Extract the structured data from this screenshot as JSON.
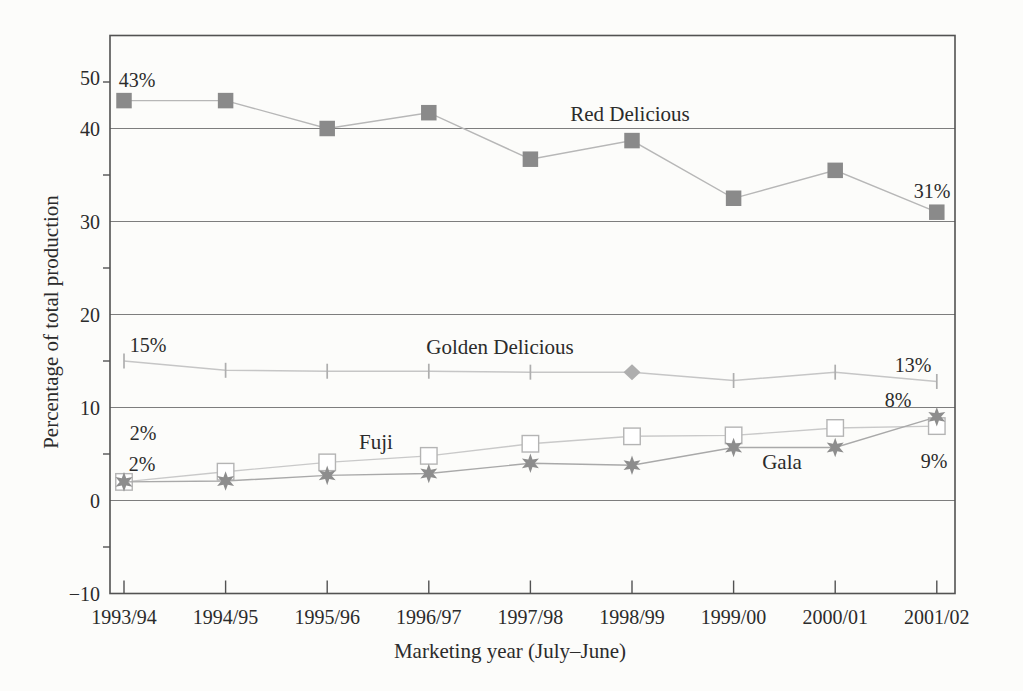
{
  "figure": {
    "background_color": "#fcfcfa",
    "text_color": "#2b2b2b",
    "grid_color": "#7d7d7d",
    "border_color": "#525252"
  },
  "chart_data": {
    "type": "line",
    "title": "",
    "xlabel": "Marketing year (July–June)",
    "ylabel": "Percentage of total production",
    "categories": [
      "1993/94",
      "1994/95",
      "1995/96",
      "1996/97",
      "1997/98",
      "1998/99",
      "1999/00",
      "2000/01",
      "2001/02"
    ],
    "ylim": [
      -10,
      50
    ],
    "grid": true,
    "gridlines_at": [
      40,
      30,
      20,
      10,
      0
    ],
    "yticks": [
      {
        "label": "50",
        "value": 50,
        "label_y": 78
      },
      {
        "label": "40",
        "value": 40
      },
      {
        "label": "30",
        "value": 30
      },
      {
        "label": "20",
        "value": 20
      },
      {
        "label": "10",
        "value": 10
      },
      {
        "label": "0",
        "value": 0
      },
      {
        "label": "−10",
        "value": -10
      }
    ],
    "minor_yticks": [
      45,
      35,
      25,
      15,
      5,
      -5
    ],
    "legend_position": "inline-labels",
    "series": [
      {
        "name": "Red Delicious",
        "marker": "filled-square",
        "marker_color": "#8a8a8a",
        "line_color": "#b7b7b7",
        "values": [
          43,
          43,
          40,
          41.7,
          36.7,
          38.7,
          32.5,
          35.5,
          31
        ]
      },
      {
        "name": "Golden Delicious",
        "marker": "vertical-tick",
        "special_marker": {
          "index": 5,
          "shape": "diamond"
        },
        "marker_color": "#aeaeae",
        "line_color": "#c6c6c6",
        "values": [
          15,
          14,
          13.9,
          13.9,
          13.8,
          13.8,
          12.9,
          13.8,
          12.8
        ]
      },
      {
        "name": "Fuji",
        "marker": "open-square",
        "marker_color": "#b4b4b4",
        "line_color": "#c9c9c9",
        "values": [
          2,
          3.1,
          4.1,
          4.8,
          6.1,
          6.9,
          7,
          7.8,
          8
        ]
      },
      {
        "name": "Gala",
        "marker": "star-6",
        "marker_color": "#8d8d8d",
        "line_color": "#a9a9a9",
        "values": [
          2,
          2.1,
          2.7,
          2.9,
          4,
          3.8,
          5.7,
          5.7,
          9
        ]
      }
    ],
    "point_labels": [
      {
        "text": "43%",
        "x": 137,
        "y": 80
      },
      {
        "text": "31%",
        "x": 932,
        "y": 191
      },
      {
        "text": "15%",
        "x": 148,
        "y": 345
      },
      {
        "text": "13%",
        "x": 913,
        "y": 365
      },
      {
        "text": "8%",
        "x": 898,
        "y": 400
      },
      {
        "text": "9%",
        "x": 934,
        "y": 461
      },
      {
        "text": "2%",
        "x": 143,
        "y": 433
      },
      {
        "text": "2%",
        "x": 142,
        "y": 464
      }
    ],
    "series_labels": [
      {
        "text": "Red Delicious",
        "x": 630,
        "y": 114
      },
      {
        "text": "Golden Delicious",
        "x": 500,
        "y": 347
      },
      {
        "text": "Fuji",
        "x": 376,
        "y": 442
      },
      {
        "text": "Gala",
        "x": 782,
        "y": 462
      }
    ]
  }
}
